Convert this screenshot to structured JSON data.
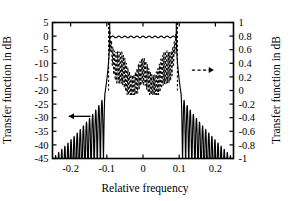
{
  "chart_data": {
    "type": "line",
    "title": "",
    "xlabel": "Relative frequency",
    "ylabel_left": "Transfer function in dB",
    "ylabel_right": "Transfer function in dB",
    "xlim": [
      -0.25,
      0.25
    ],
    "ylim_left": [
      -45,
      5
    ],
    "ylim_right": [
      -1,
      1
    ],
    "grid": false,
    "legend_position": "none",
    "xticks": [
      -0.2,
      -0.1,
      0,
      0.1,
      0.2
    ],
    "xticklabels": [
      "-0.2",
      "-0.1",
      "0",
      "0.1",
      "0.2"
    ],
    "yticks_left": [
      5,
      0,
      -5,
      -10,
      -15,
      -20,
      -25,
      -30,
      -35,
      -40,
      -45
    ],
    "yticklabels_left": [
      "5",
      "0",
      "-5",
      "-10",
      "-15",
      "-20",
      "-25",
      "-30",
      "-35",
      "-40",
      "-45"
    ],
    "yticks_right": [
      1,
      0.8,
      0.6,
      0.4,
      0.2,
      0,
      -0.2,
      -0.4,
      -0.6,
      -0.8,
      -1
    ],
    "yticklabels_right": [
      "1",
      "0.8",
      "0.6",
      "0.4",
      "0.2",
      "0",
      "-0.2",
      "-0.4",
      "-0.6",
      "-0.8",
      "-1"
    ],
    "annotations": [
      {
        "name": "left-axis-arrow",
        "style": "solid",
        "direction": "left",
        "x_from": -0.145,
        "x_to": -0.205,
        "y_left_db": -29.5
      },
      {
        "name": "right-axis-arrow",
        "style": "dashed",
        "direction": "right",
        "x_from": 0.135,
        "x_to": 0.196,
        "y_left_db": -12.5
      }
    ],
    "series": [
      {
        "name": "magnitude-response-db",
        "axis": "left",
        "style": "solid",
        "color": "#000000",
        "description": "Equiripple lowpass magnitude response in dB; passband ~0 dB from -0.092 to 0.092 with small ripple, sharp transition at +/-0.1, decaying sidelobe lobes down to -45 dB toward +/-0.25",
        "passband_edge": 0.092,
        "stopband_edge": 0.105,
        "passband_ripple_db": 0.6,
        "sidelobe_peak_db": -21.0,
        "sidelobe_floor_db": -45.0,
        "sidelobe_count_per_side": 17
      },
      {
        "name": "impulse-response-coefficients",
        "axis": "right",
        "style": "dashed",
        "color": "#000000",
        "description": "Rapidly oscillating dashed trace confined to the passband region, spanning roughly 0.0 to 0.45 on the right axis in the band center and rising steeply to 1.0 at the band edges near +/-0.095",
        "band_edge": 0.095,
        "center_band_min": 0.0,
        "center_band_max": 0.45,
        "edge_peak": 1.0,
        "oscillation_count": 46
      }
    ]
  }
}
